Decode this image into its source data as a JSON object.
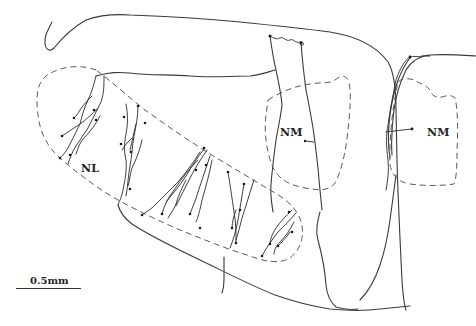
{
  "figure": {
    "type": "neuroanatomical tracing",
    "regions": [
      {
        "id": "nl",
        "label": "NL"
      },
      {
        "id": "nm-left",
        "label": "NM"
      },
      {
        "id": "nm-right",
        "label": "NM"
      }
    ],
    "scale_bar": {
      "label": "0.5mm"
    },
    "colors": {
      "line": "#3a3a3a",
      "dashed": "#5a5a5a",
      "background": "#ffffff"
    }
  }
}
